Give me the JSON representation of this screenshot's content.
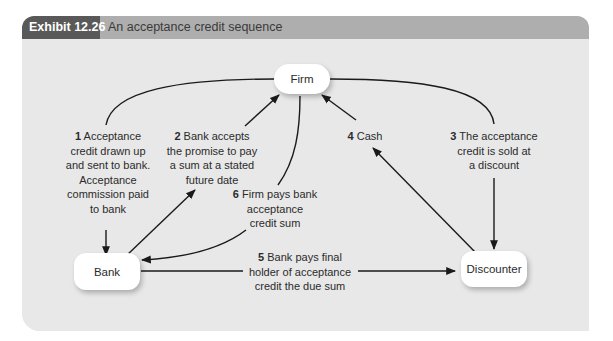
{
  "exhibit": {
    "number_label": "Exhibit 12.26",
    "title": "An acceptance credit sequence"
  },
  "nodes": {
    "firm": "Firm",
    "bank": "Bank",
    "discounter": "Discounter"
  },
  "steps": [
    {
      "num": "1",
      "lines": [
        "Acceptance",
        "credit drawn up",
        "and sent to bank.",
        "Acceptance",
        "commission paid",
        "to bank"
      ]
    },
    {
      "num": "2",
      "lines": [
        "Bank accepts",
        "the promise to pay",
        "a sum at a stated",
        "future date"
      ]
    },
    {
      "num": "3",
      "lines": [
        "The acceptance",
        "credit is sold at",
        "a discount"
      ]
    },
    {
      "num": "4",
      "lines": [
        "Cash"
      ]
    },
    {
      "num": "5",
      "lines": [
        "Bank pays final",
        "holder of acceptance",
        "credit the due sum"
      ]
    },
    {
      "num": "6",
      "lines": [
        "Firm pays bank",
        "acceptance",
        "credit sum"
      ]
    }
  ],
  "colors": {
    "header_dark": "#595959",
    "header_light": "#aeaeae",
    "panel_bg": "#e8e8e8",
    "node_bg": "#ffffff",
    "line": "#1a1a1a"
  }
}
